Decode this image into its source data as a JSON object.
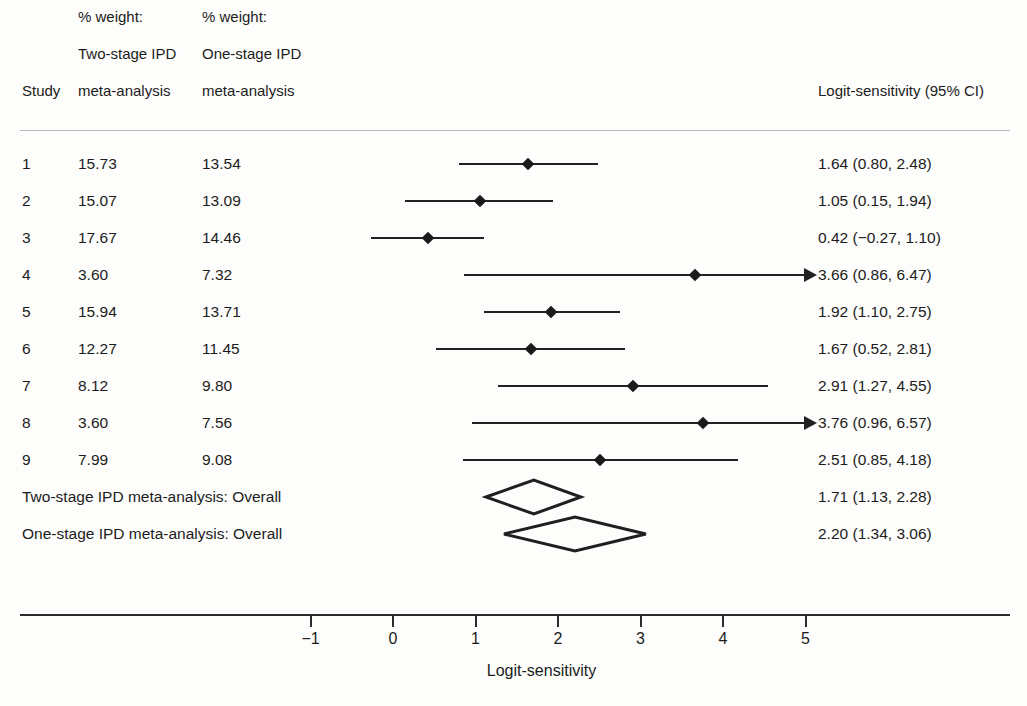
{
  "header": {
    "study_label": "Study",
    "weight_col1_line1": "% weight:",
    "weight_col1_line2": "Two-stage IPD",
    "weight_col1_line3": "meta-analysis",
    "weight_col2_line1": "% weight:",
    "weight_col2_line2": "One-stage IPD",
    "weight_col2_line3": "meta-analysis",
    "ci_label": "Logit-sensitivity (95% CI)"
  },
  "axis": {
    "title": "Logit-sensitivity",
    "ticks": [
      "−1",
      "0",
      "1",
      "2",
      "3",
      "4",
      "5"
    ],
    "tick_values": [
      -1,
      0,
      1,
      2,
      3,
      4,
      5
    ]
  },
  "rows": [
    {
      "study": "1",
      "weight_two_stage": "15.73",
      "weight_one_stage": "13.54",
      "ci_text": "1.64 (0.80, 2.48)",
      "estimate": 1.64,
      "lower": 0.8,
      "upper": 2.48,
      "truncated_right": false
    },
    {
      "study": "2",
      "weight_two_stage": "15.07",
      "weight_one_stage": "13.09",
      "ci_text": "1.05 (0.15, 1.94)",
      "estimate": 1.05,
      "lower": 0.15,
      "upper": 1.94,
      "truncated_right": false
    },
    {
      "study": "3",
      "weight_two_stage": "17.67",
      "weight_one_stage": "14.46",
      "ci_text": "0.42 (−0.27, 1.10)",
      "estimate": 0.42,
      "lower": -0.27,
      "upper": 1.1,
      "truncated_right": false
    },
    {
      "study": "4",
      "weight_two_stage": "3.60",
      "weight_one_stage": "7.32",
      "ci_text": "3.66 (0.86, 6.47)",
      "estimate": 3.66,
      "lower": 0.86,
      "upper": 6.47,
      "truncated_right": true
    },
    {
      "study": "5",
      "weight_two_stage": "15.94",
      "weight_one_stage": "13.71",
      "ci_text": "1.92 (1.10, 2.75)",
      "estimate": 1.92,
      "lower": 1.1,
      "upper": 2.75,
      "truncated_right": false
    },
    {
      "study": "6",
      "weight_two_stage": "12.27",
      "weight_one_stage": "11.45",
      "ci_text": "1.67 (0.52, 2.81)",
      "estimate": 1.67,
      "lower": 0.52,
      "upper": 2.81,
      "truncated_right": false
    },
    {
      "study": "7",
      "weight_two_stage": "8.12",
      "weight_one_stage": "9.80",
      "ci_text": "2.91 (1.27, 4.55)",
      "estimate": 2.91,
      "lower": 1.27,
      "upper": 4.55,
      "truncated_right": false
    },
    {
      "study": "8",
      "weight_two_stage": "3.60",
      "weight_one_stage": "7.56",
      "ci_text": "3.76 (0.96, 6.57)",
      "estimate": 3.76,
      "lower": 0.96,
      "upper": 6.57,
      "truncated_right": true
    },
    {
      "study": "9",
      "weight_two_stage": "7.99",
      "weight_one_stage": "9.08",
      "ci_text": "2.51 (0.85, 4.18)",
      "estimate": 2.51,
      "lower": 0.85,
      "upper": 4.18,
      "truncated_right": false
    }
  ],
  "summaries": [
    {
      "label": "Two-stage IPD meta-analysis: Overall",
      "ci_text": "1.71 (1.13, 2.28)",
      "estimate": 1.71,
      "lower": 1.13,
      "upper": 2.28
    },
    {
      "label": "One-stage IPD meta-analysis: Overall",
      "ci_text": "2.20 (1.34, 3.06)",
      "estimate": 2.2,
      "lower": 1.34,
      "upper": 3.06
    }
  ],
  "chart_data": {
    "type": "forest",
    "title": "",
    "xlabel": "Logit-sensitivity",
    "ylabel": "",
    "xlim": [
      -1.6,
      6.7
    ],
    "xticks": [
      -1,
      0,
      1,
      2,
      3,
      4,
      5
    ],
    "grid": false,
    "legend": "none",
    "effect_measure": "Logit-sensitivity (95% CI)",
    "categories": [
      "1",
      "2",
      "3",
      "4",
      "5",
      "6",
      "7",
      "8",
      "9",
      "Two-stage IPD meta-analysis: Overall",
      "One-stage IPD meta-analysis: Overall"
    ],
    "values": [
      1.64,
      1.05,
      0.42,
      3.66,
      1.92,
      1.67,
      2.91,
      3.76,
      2.51,
      1.71,
      2.2
    ],
    "ci_lower": [
      0.8,
      0.15,
      -0.27,
      0.86,
      1.1,
      0.52,
      1.27,
      0.96,
      0.85,
      1.13,
      1.34
    ],
    "ci_upper": [
      2.48,
      1.94,
      1.1,
      6.47,
      2.75,
      2.81,
      4.55,
      6.57,
      4.18,
      2.28,
      3.06
    ],
    "series": [
      {
        "name": "% weight: Two-stage IPD meta-analysis",
        "values": [
          15.73,
          15.07,
          17.67,
          3.6,
          15.94,
          12.27,
          8.12,
          3.6,
          7.99,
          null,
          null
        ]
      },
      {
        "name": "% weight: One-stage IPD meta-analysis",
        "values": [
          13.54,
          13.09,
          14.46,
          7.32,
          13.71,
          11.45,
          9.8,
          7.56,
          9.08,
          null,
          null
        ]
      }
    ],
    "summary_rows": [
      9,
      10
    ],
    "truncated_right_rows": [
      3,
      7
    ]
  },
  "colors": {
    "line": "#222222",
    "marker": "#1a1a1a",
    "text": "#1c1c1c",
    "rule": "#b9b9b9",
    "background": "#fdfdfb"
  }
}
